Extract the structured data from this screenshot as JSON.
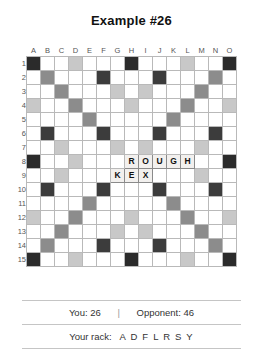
{
  "title": "Example #26",
  "board": {
    "columns": [
      "A",
      "B",
      "C",
      "D",
      "E",
      "F",
      "G",
      "H",
      "I",
      "J",
      "K",
      "L",
      "M",
      "N",
      "O"
    ],
    "rows": [
      "1",
      "2",
      "3",
      "4",
      "5",
      "6",
      "7",
      "8",
      "9",
      "10",
      "11",
      "12",
      "13",
      "14",
      "15"
    ],
    "premium_legend": {
      "tw": "triple-word",
      "dw": "double-word",
      "tl": "triple-letter",
      "dl": "double-letter",
      "ct": "center-star"
    },
    "colors": {
      "triple_word": "#2b2b2b",
      "double_word": "#8c8c8c",
      "triple_letter": "#3c3c3c",
      "double_letter": "#c8c8c8",
      "tile": "#f2f0ee",
      "grid_line": "#b9b9b9"
    },
    "premium_layout": [
      [
        "tw",
        "",
        "",
        "dl",
        "",
        "",
        "",
        "tw",
        "",
        "",
        "",
        "dl",
        "",
        "",
        "tw"
      ],
      [
        "",
        "dw",
        "",
        "",
        "",
        "tl",
        "",
        "",
        "",
        "tl",
        "",
        "",
        "",
        "dw",
        ""
      ],
      [
        "",
        "",
        "dw",
        "",
        "",
        "",
        "dl",
        "",
        "dl",
        "",
        "",
        "",
        "dw",
        "",
        ""
      ],
      [
        "dl",
        "",
        "",
        "dw",
        "",
        "",
        "",
        "dl",
        "",
        "",
        "",
        "dw",
        "",
        "",
        "dl"
      ],
      [
        "",
        "",
        "",
        "",
        "dw",
        "",
        "",
        "",
        "",
        "",
        "dw",
        "",
        "",
        "",
        ""
      ],
      [
        "",
        "tl",
        "",
        "",
        "",
        "tl",
        "",
        "",
        "",
        "tl",
        "",
        "",
        "",
        "tl",
        ""
      ],
      [
        "",
        "",
        "dl",
        "",
        "",
        "",
        "dl",
        "",
        "dl",
        "",
        "",
        "",
        "dl",
        "",
        ""
      ],
      [
        "tw",
        "",
        "",
        "dl",
        "",
        "",
        "",
        "ct",
        "",
        "",
        "",
        "dl",
        "",
        "",
        "tw"
      ],
      [
        "",
        "",
        "dl",
        "",
        "",
        "",
        "dl",
        "",
        "dl",
        "",
        "",
        "",
        "dl",
        "",
        ""
      ],
      [
        "",
        "tl",
        "",
        "",
        "",
        "tl",
        "",
        "",
        "",
        "tl",
        "",
        "",
        "",
        "tl",
        ""
      ],
      [
        "",
        "",
        "",
        "",
        "dw",
        "",
        "",
        "",
        "",
        "",
        "dw",
        "",
        "",
        "",
        ""
      ],
      [
        "dl",
        "",
        "",
        "dw",
        "",
        "",
        "",
        "dl",
        "",
        "",
        "",
        "dw",
        "",
        "",
        "dl"
      ],
      [
        "",
        "",
        "dw",
        "",
        "",
        "",
        "dl",
        "",
        "dl",
        "",
        "",
        "",
        "dw",
        "",
        ""
      ],
      [
        "",
        "dw",
        "",
        "",
        "",
        "tl",
        "",
        "",
        "",
        "tl",
        "",
        "",
        "",
        "dw",
        ""
      ],
      [
        "tw",
        "",
        "",
        "dl",
        "",
        "",
        "",
        "tw",
        "",
        "",
        "",
        "dl",
        "",
        "",
        "tw"
      ]
    ],
    "tiles": [
      {
        "row": 8,
        "col": "H",
        "letter": "R"
      },
      {
        "row": 8,
        "col": "I",
        "letter": "O"
      },
      {
        "row": 8,
        "col": "J",
        "letter": "U"
      },
      {
        "row": 8,
        "col": "K",
        "letter": "G"
      },
      {
        "row": 8,
        "col": "L",
        "letter": "H"
      },
      {
        "row": 9,
        "col": "G",
        "letter": "K"
      },
      {
        "row": 9,
        "col": "H",
        "letter": "E"
      },
      {
        "row": 9,
        "col": "I",
        "letter": "X"
      }
    ],
    "words_on_board": [
      "ROUGH",
      "KEX"
    ]
  },
  "footer": {
    "your_score_label": "You: 26",
    "separator": "|",
    "opponent_score_label": "Opponent: 46",
    "rack_label": "Your rack:",
    "rack_letters": "A D F L R S Y"
  }
}
